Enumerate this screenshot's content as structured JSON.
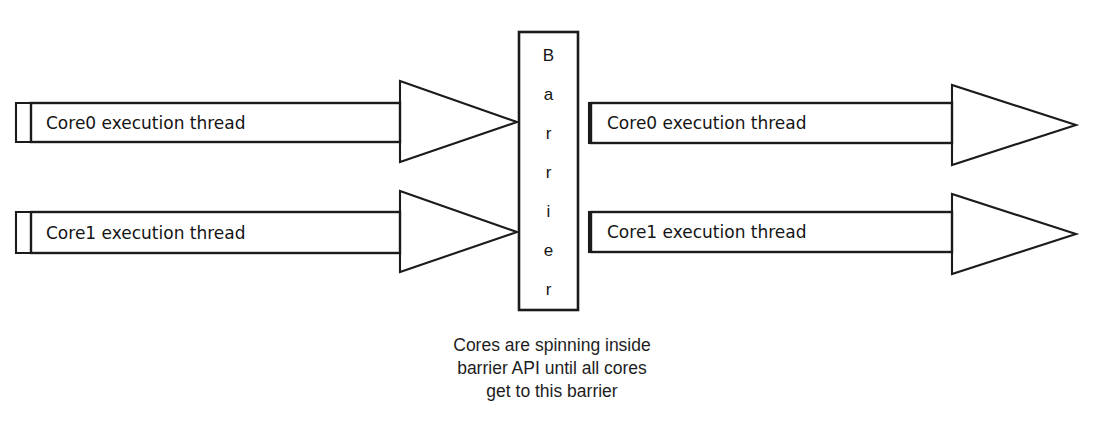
{
  "diagram": {
    "background_color": "#ffffff",
    "line_color": "#1b1b1b",
    "text_color": "#141414",
    "barrier": {
      "name": "barrier-block",
      "label": "Barrier",
      "letters": [
        "B",
        "a",
        "r",
        "r",
        "i",
        "e",
        "r"
      ]
    },
    "before_barrier": [
      {
        "name": "core0-pre-barrier-arrow",
        "label": "Core0 execution thread",
        "core": "Core0",
        "phase": "before"
      },
      {
        "name": "core1-pre-barrier-arrow",
        "label": "Core1 execution thread",
        "core": "Core1",
        "phase": "before"
      }
    ],
    "after_barrier": [
      {
        "name": "core0-post-barrier-arrow",
        "label": "Core0 execution thread",
        "core": "Core0",
        "phase": "after"
      },
      {
        "name": "core1-post-barrier-arrow",
        "label": "Core1 execution thread",
        "core": "Core1",
        "phase": "after"
      }
    ],
    "caption": {
      "name": "barrier-caption",
      "line1": "Cores are spinning inside",
      "line2": "barrier API until all cores",
      "line3": "get to this barrier",
      "full_text": "Cores are spinning inside barrier API until all cores get to this barrier"
    }
  }
}
